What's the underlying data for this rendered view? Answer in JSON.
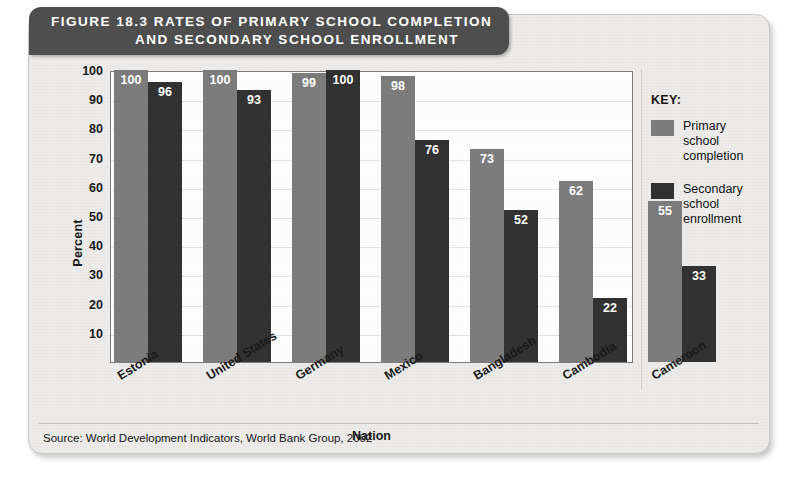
{
  "figure": {
    "title_line1": "FIGURE 18.3   RATES OF PRIMARY SCHOOL COMPLETION",
    "title_line2": "AND SECONDARY SCHOOL ENROLLMENT",
    "source": "Source: World Development Indicators, World Bank Group, 2002"
  },
  "legend": {
    "title": "KEY:",
    "items": [
      {
        "label": "Primary school completion",
        "color": "#7d7d7d"
      },
      {
        "label": "Secondary school enrollment",
        "color": "#323232"
      }
    ]
  },
  "chart_data": {
    "type": "bar",
    "title": "FIGURE 18.3   RATES OF PRIMARY SCHOOL COMPLETION AND SECONDARY SCHOOL ENROLLMENT",
    "xlabel": "Nation",
    "ylabel": "Percent",
    "ylim": [
      0,
      100
    ],
    "yticks": [
      10,
      20,
      30,
      40,
      50,
      60,
      70,
      80,
      90,
      100
    ],
    "grid": true,
    "legend_position": "right",
    "categories": [
      "Estonia",
      "United States",
      "Germany",
      "Mexico",
      "Bangladesh",
      "Cambodia",
      "Cameroon"
    ],
    "series": [
      {
        "name": "Primary school completion",
        "color": "#7d7d7d",
        "values": [
          100,
          100,
          99,
          98,
          73,
          62,
          55
        ]
      },
      {
        "name": "Secondary school enrollment",
        "color": "#323232",
        "values": [
          96,
          93,
          100,
          76,
          52,
          22,
          33
        ]
      }
    ]
  },
  "colors": {
    "banner": "#4e4e4e",
    "card": "#edecea",
    "plot_background": "#ffffff",
    "gridline": "#e3e6ec"
  }
}
